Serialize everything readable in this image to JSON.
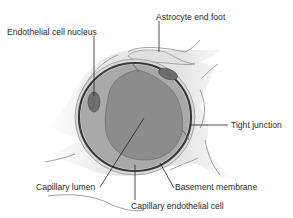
{
  "diagram": {
    "labels": {
      "astrocyte_end_foot": "Astrocyte end foot",
      "endothelial_cell_nucleus": "Endothelial cell nucleus",
      "tight_junction": "Tight junction",
      "capillary_lumen": "Capillary lumen",
      "basement_membrane": "Basement membrane",
      "capillary_endothelial_cell": "Capillary endothelial cell"
    },
    "colors": {
      "astrocyte_fill": "#e6e6e6",
      "astrocyte_outline": "#8a8a8a",
      "endothelium_fill": "#a9a9a9",
      "lumen_fill": "#8c8c8c",
      "basement_membrane": "#3a3a3a",
      "nucleus_fill": "#6e6e6e"
    }
  }
}
